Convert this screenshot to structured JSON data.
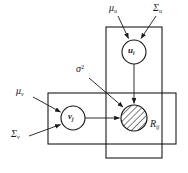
{
  "figure": {
    "type": "plate-diagram",
    "background_color": "#ffffff",
    "line_color": "#1a1a1a"
  },
  "plates": [
    {
      "id": "plate-i",
      "name": "user-plate",
      "orientation": "vertical",
      "x": 106,
      "y": 27,
      "width": 56,
      "height": 131,
      "contains": [
        "u_i",
        "R_ij"
      ]
    },
    {
      "id": "plate-j",
      "name": "item-plate",
      "orientation": "horizontal",
      "x": 48,
      "y": 93,
      "width": 128,
      "height": 51,
      "contains": [
        "v_j",
        "R_ij"
      ]
    }
  ],
  "nodes": [
    {
      "id": "u_i",
      "label": "u",
      "subscript": "i",
      "bold": true,
      "cx": 134,
      "cy": 52,
      "r": 12,
      "shaded": false,
      "style": "latent"
    },
    {
      "id": "v_j",
      "label": "v",
      "subscript": "j",
      "bold": true,
      "cx": 73,
      "cy": 118,
      "r": 12,
      "shaded": false,
      "style": "latent"
    },
    {
      "id": "R_ij",
      "label": "R",
      "subscript": "ij",
      "bold": false,
      "cx": 134,
      "cy": 118,
      "r": 13,
      "shaded": true,
      "style": "observed",
      "label_position": "outside-right-below",
      "label_x": 150,
      "label_y": 126
    }
  ],
  "parameters": [
    {
      "id": "mu_u",
      "symbol": "μ",
      "subscript": "u",
      "x": 110,
      "y": 4,
      "arrow_from": [
        120,
        16
      ],
      "arrow_to": [
        128,
        40
      ]
    },
    {
      "id": "sigma_u",
      "symbol": "Σ",
      "subscript": "u",
      "x": 155,
      "y": 4,
      "arrow_from": [
        155,
        16
      ],
      "arrow_to": [
        141,
        40
      ]
    },
    {
      "id": "mu_v",
      "symbol": "μ",
      "subscript": "v",
      "x": 16,
      "y": 88,
      "arrow_from": [
        32,
        97
      ],
      "arrow_to": [
        62,
        112
      ]
    },
    {
      "id": "sigma_v",
      "symbol": "Σ",
      "subscript": "v",
      "x": 11,
      "y": 133,
      "arrow_from": [
        28,
        137
      ],
      "arrow_to": [
        62,
        124
      ]
    },
    {
      "id": "sigma_sq",
      "symbol": "σ",
      "superscript": "2",
      "x": 76,
      "y": 66,
      "arrow_from": [
        90,
        77
      ],
      "arrow_to": [
        124,
        108
      ]
    }
  ],
  "edges": [
    {
      "id": "edge-u-to-R",
      "from": "u_i",
      "to": "R_ij",
      "x1": 134,
      "y1": 64,
      "x2": 134,
      "y2": 105
    },
    {
      "id": "edge-v-to-R",
      "from": "v_j",
      "to": "R_ij",
      "x1": 85,
      "y1": 118,
      "x2": 121,
      "y2": 118
    }
  ],
  "caption": {
    "text": "",
    "visible": false
  }
}
